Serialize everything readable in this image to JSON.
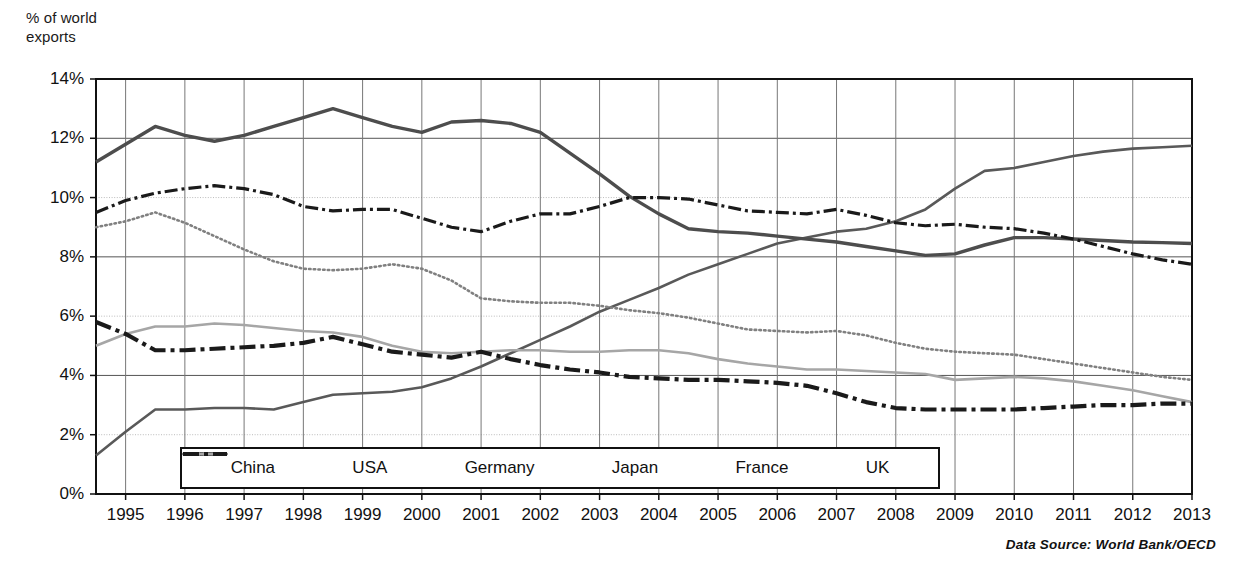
{
  "axis_title": "% of world\nexports",
  "source_note": "Data Source: World Bank/OECD",
  "legend": {
    "items": [
      {
        "label": "China",
        "style": "thin-solid"
      },
      {
        "label": "USA",
        "style": "thick-solid"
      },
      {
        "label": "Germany",
        "style": "thin-dash-dot"
      },
      {
        "label": "Japan",
        "style": "dotted"
      },
      {
        "label": "France",
        "style": "light-solid"
      },
      {
        "label": "UK",
        "style": "thick-dash-dot"
      }
    ]
  },
  "chart_data": {
    "type": "line",
    "title": "",
    "subtitle": "",
    "xlabel": "",
    "ylabel": "% of world exports",
    "ylim": [
      0,
      14
    ],
    "ytick_labels": [
      "0%",
      "2%",
      "4%",
      "6%",
      "8%",
      "10%",
      "12%",
      "14%"
    ],
    "ytick_values": [
      0,
      2,
      4,
      6,
      8,
      10,
      12,
      14
    ],
    "xlim": [
      1994.5,
      2013.0
    ],
    "xtick_labels": [
      "1995",
      "1996",
      "1997",
      "1998",
      "1999",
      "2000",
      "2001",
      "2002",
      "2003",
      "2004",
      "2005",
      "2006",
      "2007",
      "2008",
      "2009",
      "2010",
      "2011",
      "2012",
      "2013"
    ],
    "x": [
      1994.5,
      1995,
      1995.5,
      1996,
      1996.5,
      1997,
      1997.5,
      1998,
      1998.5,
      1999,
      1999.5,
      2000,
      2000.5,
      2001,
      2001.5,
      2002,
      2002.5,
      2003,
      2003.5,
      2004,
      2004.5,
      2005,
      2005.5,
      2006,
      2006.5,
      2007,
      2007.5,
      2008,
      2008.5,
      2009,
      2009.5,
      2010,
      2010.5,
      2011,
      2011.5,
      2012,
      2012.5,
      2013
    ],
    "grid": true,
    "legend_position": "inside-bottom-center",
    "series": [
      {
        "name": "China",
        "style": "thin-solid",
        "color": "#595959",
        "values": [
          1.3,
          2.1,
          2.85,
          2.85,
          2.9,
          2.9,
          2.85,
          3.1,
          3.35,
          3.4,
          3.45,
          3.6,
          3.9,
          4.3,
          4.75,
          5.2,
          5.65,
          6.15,
          6.55,
          6.95,
          7.4,
          7.75,
          8.1,
          8.45,
          8.65,
          8.85,
          8.95,
          9.2,
          9.6,
          10.3,
          10.9,
          11.0,
          11.2,
          11.4,
          11.55,
          11.65,
          11.7,
          11.75
        ]
      },
      {
        "name": "USA",
        "style": "thick-solid",
        "color": "#4d4d4d",
        "values": [
          11.2,
          11.8,
          12.4,
          12.1,
          11.9,
          12.1,
          12.4,
          12.7,
          13.0,
          12.7,
          12.4,
          12.2,
          12.55,
          12.6,
          12.5,
          12.2,
          11.5,
          10.8,
          10.05,
          9.45,
          8.95,
          8.85,
          8.8,
          8.7,
          8.6,
          8.5,
          8.35,
          8.2,
          8.05,
          8.1,
          8.4,
          8.65,
          8.65,
          8.6,
          8.55,
          8.5,
          8.48,
          8.45
        ]
      },
      {
        "name": "Germany",
        "style": "thin-dash-dot",
        "color": "#1a1a1a",
        "values": [
          9.5,
          9.9,
          10.15,
          10.3,
          10.4,
          10.3,
          10.1,
          9.7,
          9.55,
          9.6,
          9.6,
          9.3,
          9.0,
          8.85,
          9.2,
          9.45,
          9.45,
          9.7,
          10.0,
          10.0,
          9.95,
          9.75,
          9.55,
          9.5,
          9.45,
          9.6,
          9.4,
          9.15,
          9.05,
          9.1,
          9.0,
          8.95,
          8.8,
          8.6,
          8.35,
          8.1,
          7.9,
          7.75
        ]
      },
      {
        "name": "Japan",
        "style": "dotted",
        "color": "#808080",
        "values": [
          9.0,
          9.2,
          9.5,
          9.15,
          8.7,
          8.25,
          7.85,
          7.6,
          7.55,
          7.6,
          7.75,
          7.6,
          7.2,
          6.6,
          6.5,
          6.45,
          6.45,
          6.35,
          6.2,
          6.1,
          5.95,
          5.75,
          5.55,
          5.5,
          5.45,
          5.5,
          5.35,
          5.1,
          4.9,
          4.8,
          4.75,
          4.7,
          4.55,
          4.4,
          4.25,
          4.1,
          3.95,
          3.85
        ]
      },
      {
        "name": "France",
        "style": "light-solid",
        "color": "#a6a6a6",
        "values": [
          5.0,
          5.4,
          5.65,
          5.65,
          5.75,
          5.7,
          5.6,
          5.5,
          5.45,
          5.3,
          5.0,
          4.8,
          4.75,
          4.8,
          4.85,
          4.85,
          4.8,
          4.8,
          4.85,
          4.85,
          4.75,
          4.55,
          4.4,
          4.3,
          4.2,
          4.2,
          4.15,
          4.1,
          4.05,
          3.85,
          3.9,
          3.95,
          3.9,
          3.8,
          3.65,
          3.5,
          3.3,
          3.1
        ]
      },
      {
        "name": "UK",
        "style": "thick-dash-dot",
        "color": "#1a1a1a",
        "values": [
          5.8,
          5.4,
          4.85,
          4.85,
          4.9,
          4.95,
          5.0,
          5.1,
          5.3,
          5.05,
          4.8,
          4.7,
          4.6,
          4.8,
          4.55,
          4.35,
          4.2,
          4.1,
          3.95,
          3.9,
          3.85,
          3.85,
          3.8,
          3.75,
          3.65,
          3.4,
          3.1,
          2.9,
          2.85,
          2.85,
          2.85,
          2.85,
          2.9,
          2.95,
          3.0,
          3.0,
          3.05,
          3.05
        ]
      }
    ]
  }
}
